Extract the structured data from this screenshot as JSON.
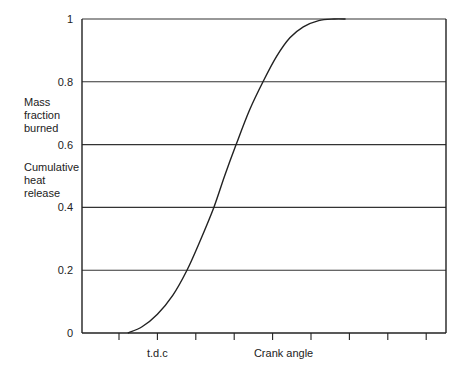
{
  "chart_data": {
    "type": "line",
    "title": "",
    "xlabel": "Crank angle",
    "ylabel_lines": [
      "Mass",
      "fraction",
      "burned",
      "",
      "Cumulative",
      "heat",
      "release"
    ],
    "ylabel_group1": [
      "Mass",
      "fraction",
      "burned"
    ],
    "ylabel_group2": [
      "Cumulative",
      "heat",
      "release"
    ],
    "ylim": [
      0,
      1
    ],
    "yticks": [
      0,
      0.2,
      0.4,
      0.6,
      0.8,
      1
    ],
    "ytick_labels": [
      "0",
      "0.2",
      "0.4",
      "0.6",
      "0.8",
      "1"
    ],
    "grid": "horizontal",
    "xlim": [
      -1,
      8.5
    ],
    "xticks": [
      0,
      1,
      2,
      3,
      4,
      5,
      6,
      7,
      8
    ],
    "x_annotations": [
      {
        "x": 1,
        "label": "t.d.c"
      }
    ],
    "xlabel_position_tick": 4,
    "series": [
      {
        "name": "Mass fraction burned",
        "x": [
          0.23,
          0.6,
          1.0,
          1.4,
          1.77,
          2.1,
          2.47,
          2.75,
          3.05,
          3.4,
          3.75,
          4.1,
          4.45,
          4.8,
          5.2,
          5.6,
          5.9
        ],
        "y": [
          0,
          0.02,
          0.06,
          0.12,
          0.2,
          0.29,
          0.4,
          0.5,
          0.6,
          0.71,
          0.8,
          0.88,
          0.94,
          0.975,
          0.995,
          1.0,
          1.0
        ]
      }
    ]
  }
}
